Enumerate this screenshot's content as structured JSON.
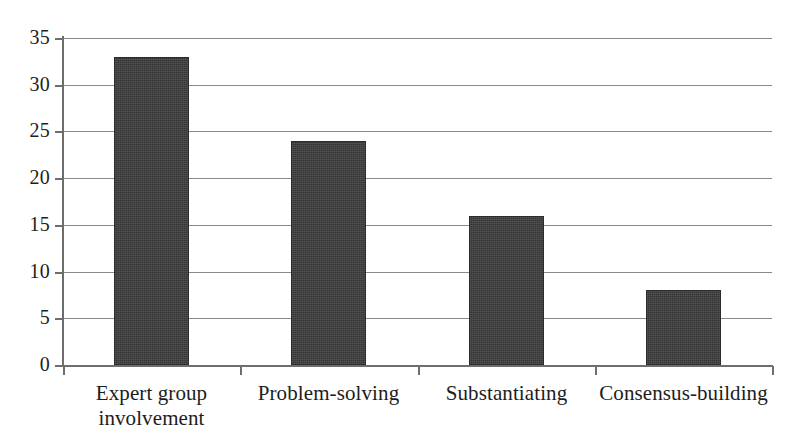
{
  "chart_data": {
    "type": "bar",
    "title": "",
    "subtitle": "",
    "xlabel": "",
    "ylabel": "",
    "categories": [
      "Expert group involvement",
      "Problem-solving",
      "Substantiating",
      "Consensus-building"
    ],
    "values": [
      33,
      24,
      16,
      8
    ],
    "series": [
      {
        "name": "",
        "values": [
          33,
          24,
          16,
          8
        ]
      }
    ],
    "ylim": [
      0,
      35
    ],
    "y_ticks": [
      0,
      5,
      10,
      15,
      20,
      25,
      30,
      35
    ],
    "y_tick_labels": [
      "0",
      "5",
      "10",
      "15",
      "20",
      "25",
      "30",
      "35"
    ],
    "grid": true,
    "grid_axis": "y",
    "legend": false,
    "legend_position": "none",
    "bar_color": "#3b3b3b",
    "grid_color": "#8a8a8a",
    "axis_color": "#6e6e6e",
    "background_color": "#ffffff",
    "annotations": []
  },
  "axis": {
    "y_ticks": [
      {
        "label": "35",
        "value": 35
      },
      {
        "label": "30",
        "value": 30
      },
      {
        "label": "25",
        "value": 25
      },
      {
        "label": "20",
        "value": 20
      },
      {
        "label": "15",
        "value": 15
      },
      {
        "label": "10",
        "value": 10
      },
      {
        "label": "5",
        "value": 5
      },
      {
        "label": "0",
        "value": 0
      }
    ]
  },
  "categories": [
    {
      "line1": "Expert group",
      "line2": "involvement",
      "value": 33
    },
    {
      "line1": "Problem-solving",
      "line2": "",
      "value": 24
    },
    {
      "line1": "Substantiating",
      "line2": "",
      "value": 16
    },
    {
      "line1": "Consensus-building",
      "line2": "",
      "value": 8
    }
  ]
}
